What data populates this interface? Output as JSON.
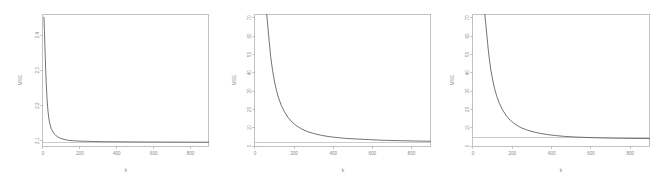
{
  "figure": {
    "background_color": "#ffffff",
    "panel_count": 3,
    "axis_color": "#a8a8a8",
    "curve_color": "#5a5a5a",
    "refline_color": "#b4b4b4",
    "tick_label_color": "#8b8b8b"
  },
  "chart_data": [
    {
      "type": "line",
      "title": "",
      "xlabel": "k",
      "ylabel": "MSE",
      "xlim": [
        0,
        900
      ],
      "ylim": [
        2.085,
        2.46
      ],
      "grid": false,
      "legend": "none",
      "frame": "box",
      "xticks": [
        0,
        200,
        400,
        600,
        800
      ],
      "xticklabels": [
        "0",
        "200",
        "400",
        "600",
        "800"
      ],
      "yticks": [
        2.1,
        2.2,
        2.3,
        2.4
      ],
      "yticklabels": [
        "2.1",
        "2.2",
        "2.3",
        "2.4"
      ],
      "reference_line": {
        "orientation": "horizontal",
        "y": 2.095
      },
      "series": [
        {
          "name": "MSE(k)",
          "x": [
            5,
            8,
            10,
            12,
            15,
            18,
            22,
            26,
            30,
            35,
            40,
            45,
            50,
            60,
            70,
            80,
            90,
            100,
            120,
            140,
            160,
            180,
            200,
            240,
            280,
            320,
            360,
            400,
            450,
            500,
            560,
            620,
            680,
            740,
            800,
            860,
            900
          ],
          "y": [
            2.452,
            2.41,
            2.375,
            2.34,
            2.295,
            2.258,
            2.218,
            2.19,
            2.17,
            2.153,
            2.142,
            2.134,
            2.129,
            2.12,
            2.115,
            2.111,
            2.108,
            2.106,
            2.103,
            2.101,
            2.1,
            2.0995,
            2.099,
            2.0982,
            2.0977,
            2.0973,
            2.0971,
            2.0969,
            2.0967,
            2.0965,
            2.0963,
            2.0962,
            2.0961,
            2.096,
            2.0959,
            2.0958,
            2.0958
          ]
        }
      ]
    },
    {
      "type": "line",
      "title": "",
      "xlabel": "k",
      "ylabel": "MSE",
      "xlim": [
        0,
        900
      ],
      "ylim": [
        0,
        72
      ],
      "grid": false,
      "legend": "none",
      "frame": "left-top",
      "xticks": [
        0,
        200,
        400,
        600,
        800
      ],
      "xticklabels": [
        "0",
        "200",
        "400",
        "600",
        "800"
      ],
      "yticks": [
        0,
        10,
        20,
        30,
        40,
        50,
        60,
        70
      ],
      "yticklabels": [
        "0",
        "10",
        "20",
        "30",
        "40",
        "50",
        "60",
        "70"
      ],
      "reference_line": {
        "orientation": "horizontal",
        "y": 2.1
      },
      "series": [
        {
          "name": "MSE(k)",
          "x": [
            60,
            65,
            70,
            75,
            80,
            90,
            100,
            110,
            120,
            135,
            150,
            170,
            190,
            210,
            240,
            270,
            300,
            340,
            380,
            420,
            470,
            520,
            580,
            640,
            700,
            760,
            820,
            880,
            900
          ],
          "y": [
            72,
            66,
            60,
            54.5,
            49,
            41,
            35,
            30.2,
            26.4,
            22.0,
            18.8,
            15.4,
            13.0,
            11.2,
            9.2,
            7.8,
            6.8,
            5.8,
            5.1,
            4.6,
            4.1,
            3.8,
            3.5,
            3.2,
            3.0,
            2.85,
            2.72,
            2.6,
            2.58
          ]
        }
      ]
    },
    {
      "type": "line",
      "title": "",
      "xlabel": "k",
      "ylabel": "MSE",
      "xlim": [
        0,
        900
      ],
      "ylim": [
        0,
        72
      ],
      "grid": false,
      "legend": "none",
      "frame": "left-top",
      "xticks": [
        0,
        200,
        400,
        600,
        800
      ],
      "xticklabels": [
        "0",
        "200",
        "400",
        "600",
        "800"
      ],
      "yticks": [
        0,
        10,
        20,
        30,
        40,
        50,
        60,
        70
      ],
      "yticklabels": [
        "0",
        "10",
        "20",
        "30",
        "40",
        "50",
        "60",
        "70"
      ],
      "reference_line": {
        "orientation": "horizontal",
        "y": 4.4
      },
      "series": [
        {
          "name": "MSE(k)",
          "x": [
            60,
            65,
            70,
            75,
            80,
            90,
            100,
            110,
            120,
            135,
            150,
            170,
            190,
            210,
            240,
            270,
            300,
            340,
            380,
            420,
            470,
            520,
            580,
            640,
            700,
            760,
            820,
            880,
            900
          ],
          "y": [
            72,
            66.5,
            61,
            55.5,
            50,
            42,
            36,
            31.2,
            27.4,
            23.0,
            19.8,
            16.4,
            14.0,
            12.2,
            10.2,
            8.9,
            7.9,
            6.9,
            6.2,
            5.7,
            5.2,
            4.9,
            4.65,
            4.45,
            4.3,
            4.2,
            4.1,
            4.05,
            4.02
          ]
        }
      ]
    }
  ]
}
